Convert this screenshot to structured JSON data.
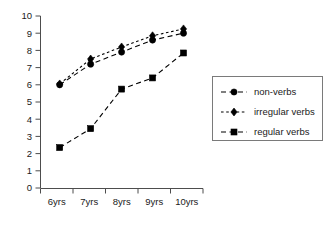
{
  "chart_data": {
    "type": "line",
    "title": "",
    "xlabel": "",
    "ylabel": "",
    "categories": [
      "6yrs",
      "7yrs",
      "8yrs",
      "9yrs",
      "10yrs"
    ],
    "ylim": [
      0,
      10
    ],
    "yticks": [
      0,
      1,
      2,
      3,
      4,
      5,
      6,
      7,
      8,
      9,
      10
    ],
    "grid": false,
    "legend_position": "right",
    "series": [
      {
        "name": "non-verbs",
        "marker": "circle",
        "linestyle": "dashed",
        "color": "#000000",
        "values": [
          6.0,
          7.2,
          7.9,
          8.6,
          9.0
        ]
      },
      {
        "name": "irregular verbs",
        "marker": "diamond",
        "linestyle": "dotted",
        "color": "#000000",
        "values": [
          6.05,
          7.5,
          8.2,
          8.85,
          9.25
        ]
      },
      {
        "name": "regular verbs",
        "marker": "square",
        "linestyle": "dashed",
        "color": "#000000",
        "values": [
          2.35,
          3.45,
          5.75,
          6.4,
          7.85
        ]
      }
    ]
  },
  "axis": {
    "y_tick_labels": [
      "0",
      "1",
      "2",
      "3",
      "4",
      "5",
      "6",
      "7",
      "8",
      "9",
      "10"
    ],
    "x_tick_labels": [
      "6yrs",
      "7yrs",
      "8yrs",
      "9yrs",
      "10yrs"
    ]
  },
  "legend": {
    "entries": [
      {
        "label": "non-verbs",
        "marker": "circle-marker"
      },
      {
        "label": "irregular verbs",
        "marker": "diamond-marker"
      },
      {
        "label": "regular verbs",
        "marker": "square-marker"
      }
    ]
  }
}
